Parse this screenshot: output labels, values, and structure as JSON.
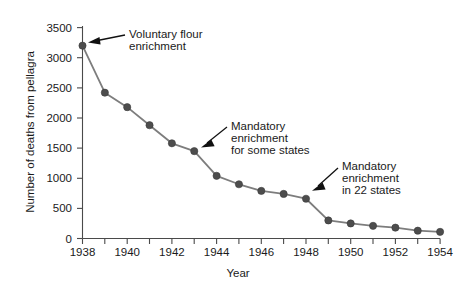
{
  "chart_data": {
    "type": "line",
    "title": "",
    "subtitle": "",
    "xlabel": "Year",
    "ylabel": "Number of deaths from pellagra",
    "xlim": [
      1938,
      1954
    ],
    "ylim": [
      0,
      3500
    ],
    "xticks": [
      1938,
      1939,
      1940,
      1941,
      1942,
      1943,
      1944,
      1945,
      1946,
      1947,
      1948,
      1949,
      1950,
      1951,
      1952,
      1953,
      1954
    ],
    "xtick_labels": [
      "1938",
      "",
      "1940",
      "",
      "1942",
      "",
      "1944",
      "",
      "1946",
      "",
      "1948",
      "",
      "1950",
      "",
      "1952",
      "",
      "1954"
    ],
    "yticks": [
      0,
      500,
      1000,
      1500,
      2000,
      2500,
      3000,
      3500
    ],
    "ytick_labels": [
      "0",
      "500",
      "1000",
      "1500",
      "2000",
      "2500",
      "3000",
      "3500"
    ],
    "grid": false,
    "legend": false,
    "legend_position": "none",
    "marker": "circle",
    "line_color": "#7d7d7d",
    "marker_color": "#4d4d4d",
    "x": [
      1938,
      1939,
      1940,
      1941,
      1942,
      1943,
      1944,
      1945,
      1946,
      1947,
      1948,
      1949,
      1950,
      1951,
      1952,
      1953,
      1954
    ],
    "values": [
      3200,
      2420,
      2180,
      1880,
      1580,
      1450,
      1040,
      900,
      790,
      740,
      660,
      300,
      250,
      210,
      180,
      130,
      110
    ],
    "series": [
      {
        "name": "Deaths from pellagra",
        "values": [
          3200,
          2420,
          2180,
          1880,
          1580,
          1450,
          1040,
          900,
          790,
          740,
          660,
          300,
          250,
          210,
          180,
          130,
          110
        ]
      }
    ],
    "annotations": [
      {
        "id": "voluntary-flour-enrichment",
        "text": "Voluntary flour enrichment",
        "lines": [
          "Voluntary flour",
          "enrichment"
        ],
        "target_x": 1938,
        "target_y": 3200
      },
      {
        "id": "mandatory-enrichment-some-states",
        "text": "Mandatory enrichment for some states",
        "lines": [
          "Mandatory",
          "enrichment",
          "for some states"
        ],
        "target_x": 1943,
        "target_y": 1450
      },
      {
        "id": "mandatory-enrichment-22-states",
        "text": "Mandatory enrichment in 22 states",
        "lines": [
          "Mandatory",
          "enrichment",
          "in 22 states"
        ],
        "target_x": 1948,
        "target_y": 660
      }
    ]
  },
  "axes": {
    "y_title": "Number of deaths from pellagra",
    "x_title": "Year",
    "y_labels": {
      "t0": "0",
      "t1": "500",
      "t2": "1000",
      "t3": "1500",
      "t4": "2000",
      "t5": "2500",
      "t6": "3000",
      "t7": "3500"
    },
    "x_labels": {
      "t1938": "1938",
      "t1940": "1940",
      "t1942": "1942",
      "t1944": "1944",
      "t1946": "1946",
      "t1948": "1948",
      "t1950": "1950",
      "t1952": "1952",
      "t1954": "1954"
    }
  },
  "annotations": {
    "a1": {
      "l1": "Voluntary flour",
      "l2": "enrichment"
    },
    "a2": {
      "l1": "Mandatory",
      "l2": "enrichment",
      "l3": "for some states"
    },
    "a3": {
      "l1": "Mandatory",
      "l2": "enrichment",
      "l3": "in 22 states"
    }
  }
}
